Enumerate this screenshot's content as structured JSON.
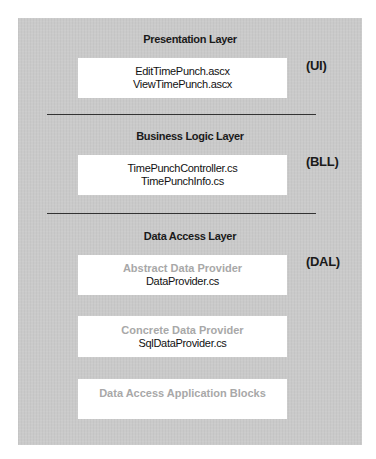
{
  "diagram": {
    "layers": [
      {
        "title": "Presentation Layer",
        "tag": "(UI)",
        "boxes": [
          {
            "lines": [
              "EditTimePunch.ascx",
              "ViewTimePunch.ascx"
            ]
          }
        ]
      },
      {
        "title": "Business Logic Layer",
        "tag": "(BLL)",
        "boxes": [
          {
            "lines": [
              "TimePunchController.cs",
              "TimePunchInfo.cs"
            ]
          }
        ]
      },
      {
        "title": "Data Access Layer",
        "tag": "(DAL)",
        "boxes": [
          {
            "caption": "Abstract Data Provider",
            "lines": [
              "DataProvider.cs"
            ]
          },
          {
            "caption": "Concrete Data Provider",
            "lines": [
              "SqlDataProvider.cs"
            ]
          },
          {
            "caption": "Data Access Application Blocks",
            "lines": []
          }
        ]
      }
    ],
    "colors": {
      "panel": "#cacaca",
      "box": "#ffffff",
      "text": "#1a1a1a",
      "muted_text": "#a8a8a8",
      "separator": "#333333"
    }
  }
}
